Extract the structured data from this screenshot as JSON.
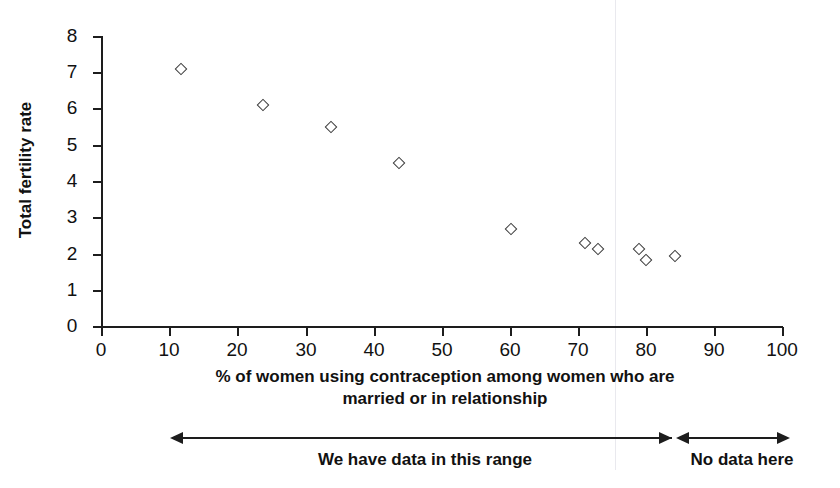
{
  "chart_data": {
    "type": "scatter",
    "title": "",
    "xlabel": "% of women using contraception among women who are married or in relationship",
    "xlabel_line1": "% of women using contraception among women who are",
    "xlabel_line2": "married or in relationship",
    "ylabel": "Total fertility rate",
    "xlim": [
      0,
      100
    ],
    "ylim": [
      0,
      8
    ],
    "xticks": [
      0,
      10,
      20,
      30,
      40,
      50,
      60,
      70,
      80,
      90,
      100
    ],
    "xtick_labels": [
      "0",
      "10",
      "20",
      "30",
      "40",
      "50",
      "60",
      "70",
      "80",
      "90",
      "100"
    ],
    "yticks": [
      0,
      1,
      2,
      3,
      4,
      5,
      6,
      7,
      8
    ],
    "ytick_labels": [
      "0",
      "1",
      "2",
      "3",
      "4",
      "5",
      "6",
      "7",
      "8"
    ],
    "grid": false,
    "legend": null,
    "marker": "open-diamond",
    "marker_color": "#3a3a3a",
    "points": [
      {
        "x": 11.8,
        "y": 7.1
      },
      {
        "x": 23.8,
        "y": 6.1
      },
      {
        "x": 33.8,
        "y": 5.5
      },
      {
        "x": 43.8,
        "y": 4.5
      },
      {
        "x": 60.2,
        "y": 2.7
      },
      {
        "x": 71.1,
        "y": 2.3
      },
      {
        "x": 73.0,
        "y": 2.15
      },
      {
        "x": 79.0,
        "y": 2.15
      },
      {
        "x": 80.1,
        "y": 1.85
      },
      {
        "x": 84.3,
        "y": 1.95
      }
    ],
    "annotations": [
      {
        "id": "data-range",
        "text": "We have data in this range",
        "x_start": 10,
        "x_end": 84,
        "style": "double-arrow"
      },
      {
        "id": "no-data",
        "text": "No data here",
        "x_start": 84,
        "x_end": 101,
        "style": "double-arrow"
      }
    ]
  }
}
